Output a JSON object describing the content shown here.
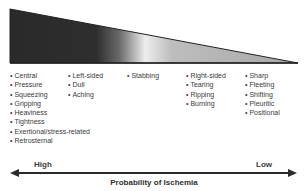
{
  "diagram": {
    "columns": [
      {
        "items": [
          "Central",
          "Pressure",
          "Squeezing",
          "Gripping",
          "Heaviness",
          "Tightness",
          "Exertional/stress-related",
          "Retrosternal"
        ]
      },
      {
        "items": [
          "Left-sided",
          "Dull",
          "Aching"
        ]
      },
      {
        "items": [
          "Stabbing"
        ]
      },
      {
        "items": [
          "Right-sided",
          "Tearing",
          "Ripping",
          "Burning"
        ]
      },
      {
        "items": [
          "Sharp",
          "Fleeting",
          "Shifting",
          "Pleuritic",
          "Positional"
        ]
      }
    ],
    "axis": {
      "high_label": "High",
      "low_label": "Low",
      "title": "Probability of Ischemia"
    },
    "colors": {
      "dark": "#2a2a2a",
      "light": "#ececec",
      "mid": "#b4b4b4",
      "text": "#3a3a3a"
    }
  }
}
